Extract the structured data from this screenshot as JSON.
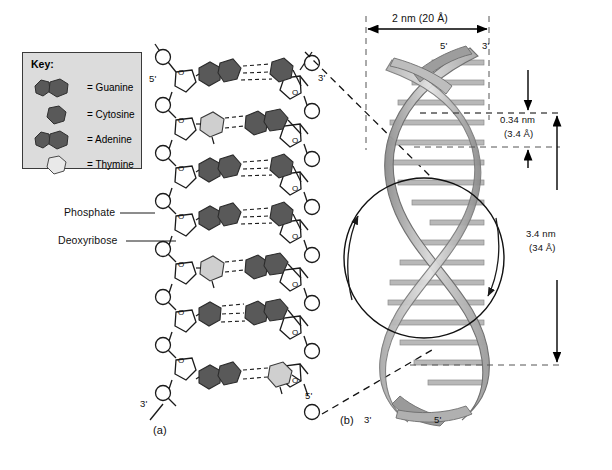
{
  "figure": {
    "panels": [
      {
        "id": "a",
        "label": "(a)",
        "description": "Chemical ladder structure of DNA"
      },
      {
        "id": "b",
        "label": "(b)",
        "description": "Three-dimensional double helix"
      }
    ]
  },
  "key": {
    "title": "Key:",
    "items": [
      {
        "label": "= Guanine",
        "shape": "purine-double-ring",
        "fill": "#595959"
      },
      {
        "label": "= Cytosine",
        "shape": "pyrimidine-single-ring",
        "fill": "#595959"
      },
      {
        "label": "= Adenine",
        "shape": "purine-double-ring",
        "fill": "#595959"
      },
      {
        "label": "= Thymine",
        "shape": "pyrimidine-single-ring",
        "fill": "#e3e3e3"
      }
    ]
  },
  "callouts": {
    "phosphate": "Phosphate",
    "deoxyribose": "Deoxyribose"
  },
  "ladder": {
    "left_top_label": "5'",
    "left_bottom_label": "3'",
    "right_top_label": "3'",
    "right_bottom_label": "5'",
    "base_pairs": [
      {
        "left": "Adenine",
        "left_type": "purine",
        "left_fill": "#595959",
        "right": "Thymine",
        "right_type": "pyrimidine",
        "right_fill": "#595959"
      },
      {
        "left": "Thymine",
        "left_type": "pyrimidine",
        "left_fill": "#cfcfcf",
        "right": "Adenine",
        "right_type": "purine",
        "right_fill": "#595959"
      },
      {
        "left": "Guanine",
        "left_type": "purine",
        "left_fill": "#595959",
        "right": "Cytosine",
        "right_type": "pyrimidine",
        "right_fill": "#595959"
      },
      {
        "left": "Adenine",
        "left_type": "purine",
        "left_fill": "#595959",
        "right": "Cytosine",
        "right_type": "pyrimidine",
        "right_fill": "#595959"
      },
      {
        "left": "Thymine",
        "left_type": "pyrimidine",
        "left_fill": "#cfcfcf",
        "right": "Adenine",
        "right_type": "purine",
        "right_fill": "#595959"
      },
      {
        "left": "Guanine",
        "left_type": "purine",
        "left_fill": "#595959",
        "right": "Adenine",
        "right_type": "purine",
        "right_fill": "#595959"
      },
      {
        "left": "Adenine",
        "left_type": "purine",
        "left_fill": "#595959",
        "right": "Thymine",
        "right_type": "pyrimidine",
        "right_fill": "#cfcfcf"
      }
    ]
  },
  "helix": {
    "top_left_label": "5'",
    "top_right_label": "3'",
    "bottom_left_label": "3'",
    "bottom_right_label": "5'",
    "ribbon_light": "#c9c9c9",
    "ribbon_dark": "#8a8a8a",
    "rung_color": "#b5b5b5"
  },
  "dimensions": {
    "width": {
      "value": "2 nm (20 Å)",
      "orientation": "horizontal"
    },
    "rise": {
      "line1": "0.34 nm",
      "line2": "(3.4 Å)",
      "orientation": "vertical"
    },
    "pitch": {
      "line1": "3.4 nm",
      "line2": "(34 Å)",
      "orientation": "vertical"
    }
  }
}
